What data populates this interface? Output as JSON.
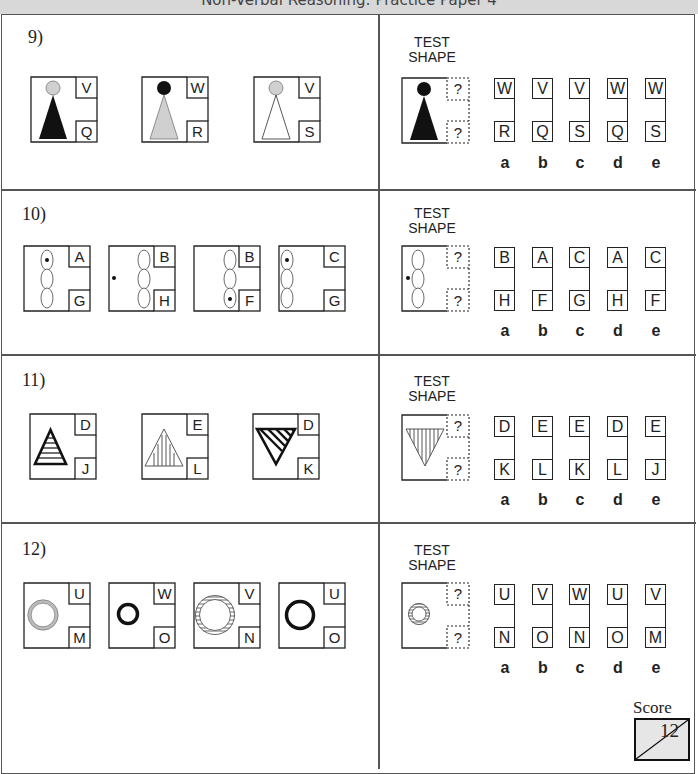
{
  "header": {
    "title": "Non-Verbal Reasoning: Practice Paper 4"
  },
  "test_shape_label": [
    "TEST",
    "SHAPE"
  ],
  "option_labels": [
    "a",
    "b",
    "c",
    "d",
    "e"
  ],
  "questions": [
    {
      "number": "9)",
      "examples": [
        {
          "shape": "grey-circle-black-triangle",
          "top": "V",
          "bottom": "Q"
        },
        {
          "shape": "black-circle-grey-triangle",
          "top": "W",
          "bottom": "R"
        },
        {
          "shape": "grey-circle-white-triangle",
          "top": "V",
          "bottom": "S"
        }
      ],
      "test_shape": {
        "shape": "black-circle-black-triangle",
        "top": "?",
        "bottom": "?"
      },
      "options": [
        {
          "label": "a",
          "top": "W",
          "bottom": "R"
        },
        {
          "label": "b",
          "top": "V",
          "bottom": "Q"
        },
        {
          "label": "c",
          "top": "V",
          "bottom": "S"
        },
        {
          "label": "d",
          "top": "W",
          "bottom": "Q"
        },
        {
          "label": "e",
          "top": "W",
          "bottom": "S"
        }
      ]
    },
    {
      "number": "10)",
      "examples": [
        {
          "shape": "three-ovals-dot-in-top",
          "top": "A",
          "bottom": "G"
        },
        {
          "shape": "three-ovals-dot-left-outside",
          "top": "B",
          "bottom": "H"
        },
        {
          "shape": "three-ovals-dot-in-bottom",
          "top": "B",
          "bottom": "F"
        },
        {
          "shape": "three-ovals-dot-in-top-left",
          "top": "C",
          "bottom": "G"
        }
      ],
      "test_shape": {
        "shape": "three-ovals-dot-left-outside",
        "top": "?",
        "bottom": "?"
      },
      "options": [
        {
          "label": "a",
          "top": "B",
          "bottom": "H"
        },
        {
          "label": "b",
          "top": "A",
          "bottom": "F"
        },
        {
          "label": "c",
          "top": "C",
          "bottom": "G"
        },
        {
          "label": "d",
          "top": "A",
          "bottom": "H"
        },
        {
          "label": "e",
          "top": "C",
          "bottom": "F"
        }
      ]
    },
    {
      "number": "11)",
      "examples": [
        {
          "shape": "thick-triangle-horizontal-stripes",
          "top": "D",
          "bottom": "J"
        },
        {
          "shape": "thin-triangle-vertical-stripes",
          "top": "E",
          "bottom": "L"
        },
        {
          "shape": "thick-inverted-triangle-diagonal-stripes",
          "top": "D",
          "bottom": "K"
        }
      ],
      "test_shape": {
        "shape": "thin-inverted-triangle-vertical-stripes",
        "top": "?",
        "bottom": "?"
      },
      "options": [
        {
          "label": "a",
          "top": "D",
          "bottom": "K"
        },
        {
          "label": "b",
          "top": "E",
          "bottom": "L"
        },
        {
          "label": "c",
          "top": "E",
          "bottom": "K"
        },
        {
          "label": "d",
          "top": "D",
          "bottom": "L"
        },
        {
          "label": "e",
          "top": "E",
          "bottom": "J"
        }
      ]
    },
    {
      "number": "12)",
      "examples": [
        {
          "shape": "large-grey-ring",
          "top": "U",
          "bottom": "M"
        },
        {
          "shape": "small-black-ring",
          "top": "W",
          "bottom": "O"
        },
        {
          "shape": "large-striped-ring",
          "top": "V",
          "bottom": "N"
        },
        {
          "shape": "large-black-ring",
          "top": "U",
          "bottom": "O"
        }
      ],
      "test_shape": {
        "shape": "small-striped-ring",
        "top": "?",
        "bottom": "?"
      },
      "options": [
        {
          "label": "a",
          "top": "U",
          "bottom": "N"
        },
        {
          "label": "b",
          "top": "V",
          "bottom": "O"
        },
        {
          "label": "c",
          "top": "W",
          "bottom": "N"
        },
        {
          "label": "d",
          "top": "U",
          "bottom": "O"
        },
        {
          "label": "e",
          "top": "V",
          "bottom": "M"
        }
      ]
    }
  ],
  "score": {
    "label": "Score",
    "total": "12"
  },
  "colors": {
    "ink": "#222222",
    "grey_fill": "#d0d0d0",
    "score_fill": "#e6e6e6",
    "header_bg": "#d8d8d8"
  }
}
